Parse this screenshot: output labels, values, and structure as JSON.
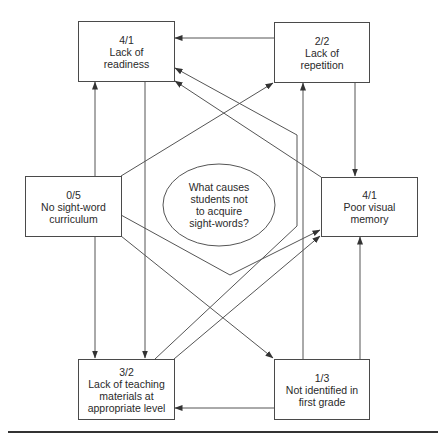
{
  "diagram": {
    "center": {
      "lines": [
        "What causes",
        "students not",
        "to acquire",
        "sight-words?"
      ]
    },
    "nodes": [
      {
        "id": "lack-of-readiness",
        "score": "4/1",
        "lines": [
          "Lack of",
          "readiness"
        ]
      },
      {
        "id": "lack-of-repetition",
        "score": "2/2",
        "lines": [
          "Lack of",
          "repetition"
        ]
      },
      {
        "id": "no-sight-word-curriculum",
        "score": "0/5",
        "lines": [
          "No sight-word",
          "curriculum"
        ]
      },
      {
        "id": "poor-visual-memory",
        "score": "4/1",
        "lines": [
          "Poor visual",
          "memory"
        ]
      },
      {
        "id": "lack-of-teaching-materials",
        "score": "3/2",
        "lines": [
          "Lack of teaching",
          "materials at",
          "appropriate level"
        ]
      },
      {
        "id": "not-identified-first-grade",
        "score": "1/3",
        "lines": [
          "Not identified in",
          "first grade"
        ]
      }
    ],
    "edges": [
      {
        "from": "lack-of-repetition",
        "to": "lack-of-readiness"
      },
      {
        "from": "no-sight-word-curriculum",
        "to": "lack-of-readiness"
      },
      {
        "from": "no-sight-word-curriculum",
        "to": "lack-of-teaching-materials"
      },
      {
        "from": "no-sight-word-curriculum",
        "to": "lack-of-repetition"
      },
      {
        "from": "no-sight-word-curriculum",
        "to": "poor-visual-memory"
      },
      {
        "from": "no-sight-word-curriculum",
        "to": "not-identified-first-grade"
      },
      {
        "from": "lack-of-readiness",
        "to": "lack-of-teaching-materials"
      },
      {
        "from": "lack-of-teaching-materials",
        "to": "lack-of-readiness"
      },
      {
        "from": "lack-of-teaching-materials",
        "to": "poor-visual-memory"
      },
      {
        "from": "poor-visual-memory",
        "to": "lack-of-readiness"
      },
      {
        "from": "lack-of-repetition",
        "to": "poor-visual-memory"
      },
      {
        "from": "not-identified-first-grade",
        "to": "lack-of-repetition"
      },
      {
        "from": "not-identified-first-grade",
        "to": "poor-visual-memory"
      },
      {
        "from": "not-identified-first-grade",
        "to": "lack-of-teaching-materials"
      }
    ]
  }
}
